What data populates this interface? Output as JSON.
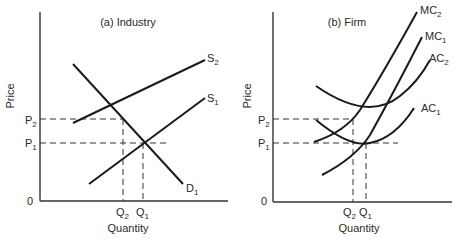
{
  "panels": [
    {
      "title": "(a) Industry",
      "xlabel": "Quantity",
      "ylabel": "Price",
      "origin": "0",
      "price_levels": [
        {
          "base": "P",
          "sub": "2"
        },
        {
          "base": "P",
          "sub": "1"
        }
      ],
      "quantity_levels": [
        {
          "base": "Q",
          "sub": "2"
        },
        {
          "base": "Q",
          "sub": "1"
        }
      ],
      "curves": [
        {
          "base": "S",
          "sub": "2"
        },
        {
          "base": "S",
          "sub": "1"
        },
        {
          "base": "D",
          "sub": "1"
        }
      ]
    },
    {
      "title": "(b) Firm",
      "xlabel": "Quantity",
      "ylabel": "Price",
      "origin": "0",
      "price_levels": [
        {
          "base": "P",
          "sub": "2"
        },
        {
          "base": "P",
          "sub": "1"
        }
      ],
      "quantity_levels": [
        {
          "base": "Q",
          "sub": "2"
        },
        {
          "base": "Q",
          "sub": "1"
        }
      ],
      "curves": [
        {
          "base": "MC",
          "sub": "2"
        },
        {
          "base": "MC",
          "sub": "1"
        },
        {
          "base": "AC",
          "sub": "2"
        },
        {
          "base": "AC",
          "sub": "1"
        }
      ]
    }
  ]
}
